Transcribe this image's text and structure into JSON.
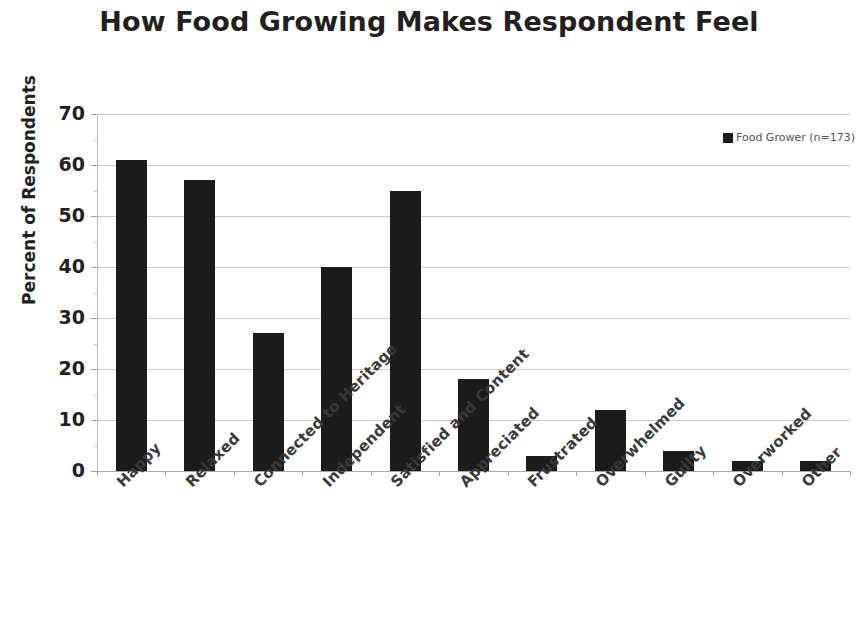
{
  "chart_data": {
    "type": "bar",
    "title": "How Food Growing Makes Respondent Feel",
    "xlabel": "",
    "ylabel": "Percent of Respondents",
    "categories": [
      "Happy",
      "Relaxed",
      "Connected to Heritage",
      "Independent",
      "Satisfied and Content",
      "Appreciated",
      "Frustrated",
      "Overwhelmed",
      "Guilty",
      "Overworked",
      "Other"
    ],
    "values": [
      61,
      57,
      27,
      40,
      55,
      18,
      3,
      12,
      4,
      2,
      2
    ],
    "series": [
      {
        "name": "Food Grower  (n=173)",
        "values": [
          61,
          57,
          27,
          40,
          55,
          18,
          3,
          12,
          4,
          2,
          2
        ]
      }
    ],
    "ylim": [
      0,
      70
    ],
    "yticks": [
      0,
      10,
      20,
      30,
      40,
      50,
      60,
      70
    ],
    "ytick_labels": [
      "0",
      "10",
      "20",
      "30",
      "40",
      "50",
      "60",
      "70"
    ],
    "grid": true,
    "legend_position": "top-right",
    "bar_color": "#1b1b1b"
  },
  "legend": {
    "entries": [
      {
        "label": "Food Grower  (n=173)",
        "color": "#1b1b1b"
      }
    ]
  }
}
